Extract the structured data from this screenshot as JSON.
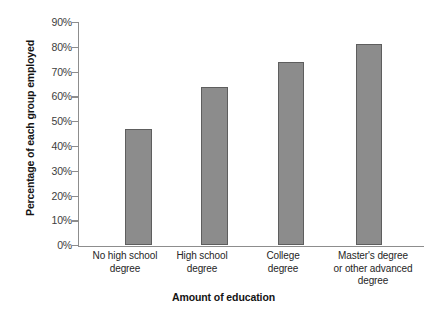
{
  "chart_data": {
    "type": "bar",
    "title": "",
    "xlabel": "Amount of education",
    "ylabel": "Percentage of each group employed",
    "categories": [
      "No high school degree",
      "High school degree",
      "College degree",
      "Master's degree or other advanced degree"
    ],
    "category_lines": [
      [
        "No high school",
        "degree"
      ],
      [
        "High school",
        "degree"
      ],
      [
        "College",
        "degree"
      ],
      [
        "Master's degree",
        "or other advanced",
        "degree"
      ]
    ],
    "values": [
      47,
      64,
      74,
      81
    ],
    "ylim": [
      0,
      90
    ],
    "ytick_values": [
      90,
      80,
      70,
      60,
      50,
      40,
      30,
      20,
      10,
      0
    ],
    "ytick_labels": [
      "90%",
      "80%",
      "70%",
      "60%",
      "50%",
      "40%",
      "30%",
      "20%",
      "10%",
      "0%"
    ],
    "grid": false,
    "legend": "none",
    "bar_color": "#8c8c8c",
    "bar_edge_color": "#5e5e5e",
    "axis_color": "#8d8d8d"
  }
}
